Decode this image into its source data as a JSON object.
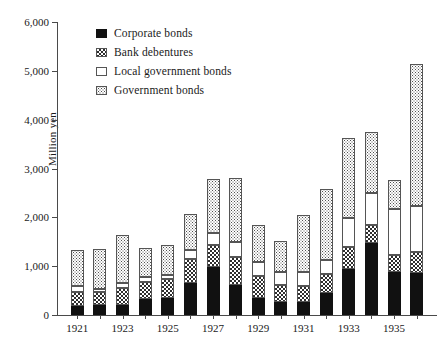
{
  "figure": {
    "ylabel": "Million yen",
    "caption": ""
  },
  "legend": {
    "position": "top-left-inside",
    "items": [
      {
        "label": "Corporate bonds",
        "swatch": "solid-black-swatch",
        "color": "#111111"
      },
      {
        "label": "Bank debentures",
        "swatch": "checker-pattern-swatch",
        "color": "#2e2e2e"
      },
      {
        "label": "Local government bonds",
        "swatch": "white-outline-swatch",
        "color": "#ffffff"
      },
      {
        "label": "Government bonds",
        "swatch": "dotted-pattern-swatch",
        "color": "#4f4f4f"
      }
    ]
  },
  "yaxis": {
    "ticks": [
      "0",
      "1,000",
      "2,000",
      "3,000",
      "4,000",
      "5,000",
      "6,000"
    ],
    "tick_values": [
      0,
      1000,
      2000,
      3000,
      4000,
      5000,
      6000
    ]
  },
  "xaxis": {
    "labels": [
      "1921",
      "1923",
      "1925",
      "1927",
      "1929",
      "1931",
      "1933",
      "1935"
    ]
  },
  "chart_data": {
    "type": "bar",
    "title": "",
    "subtitle": "",
    "xlabel": "",
    "ylabel": "Million yen",
    "ylim": [
      0,
      6000
    ],
    "grid": false,
    "stacked": true,
    "legend_position": "top-left-inside",
    "categories": [
      "1921",
      "1922",
      "1923",
      "1924",
      "1925",
      "1926",
      "1927",
      "1928",
      "1929",
      "1930",
      "1931",
      "1932",
      "1933",
      "1934",
      "1935",
      "1936"
    ],
    "xtick_labels": [
      "1921",
      "",
      "1923",
      "",
      "1925",
      "",
      "1927",
      "",
      "1929",
      "",
      "1931",
      "",
      "1933",
      "",
      "1935",
      ""
    ],
    "series": [
      {
        "name": "Corporate bonds",
        "values": [
          180,
          200,
          200,
          330,
          350,
          660,
          990,
          620,
          340,
          270,
          260,
          450,
          950,
          1470,
          890,
          870
        ]
      },
      {
        "name": "Bank debentures",
        "values": [
          290,
          270,
          360,
          340,
          380,
          490,
          450,
          570,
          450,
          340,
          330,
          380,
          440,
          370,
          340,
          420
        ]
      },
      {
        "name": "Local government bonds",
        "values": [
          120,
          70,
          100,
          100,
          90,
          180,
          230,
          310,
          290,
          270,
          300,
          300,
          600,
          660,
          950,
          940
        ]
      },
      {
        "name": "Government bonds",
        "values": [
          740,
          810,
          980,
          600,
          620,
          730,
          1120,
          1300,
          760,
          640,
          1160,
          1450,
          1630,
          1250,
          590,
          2920
        ]
      }
    ],
    "totals": [
      1330,
      1350,
      1640,
      1370,
      1440,
      2060,
      2790,
      2800,
      1840,
      1520,
      2050,
      2580,
      3620,
      3750,
      2770,
      5150
    ]
  }
}
